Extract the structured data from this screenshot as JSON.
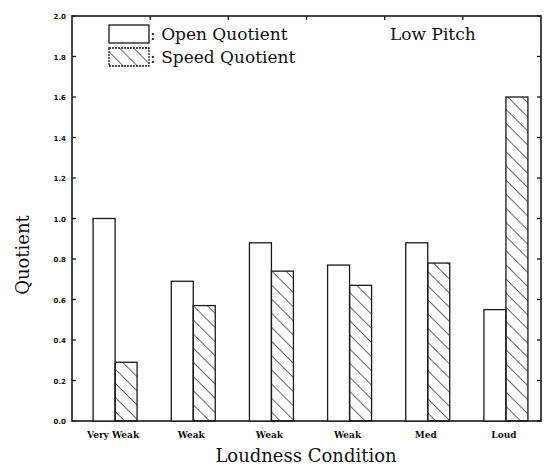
{
  "chart_data": {
    "type": "bar",
    "title": "",
    "annotation": "Low Pitch",
    "xlabel": "Loudness Condition",
    "ylabel": "Quotient",
    "ylim": [
      0,
      2.0
    ],
    "yticks": [
      "0.0",
      "0.2",
      "0.4",
      "0.6",
      "0.8",
      "1.0",
      "1.2",
      "1.4",
      "1.6",
      "1.8",
      "2.0"
    ],
    "grid": false,
    "legend_position": "top-left inside",
    "categories": [
      "Very Weak",
      "Weak",
      "Weak",
      "Weak",
      "Med",
      "Loud"
    ],
    "series": [
      {
        "name": "Open Quotient",
        "pattern": "empty",
        "values": [
          1.0,
          0.69,
          0.88,
          0.77,
          0.88,
          0.55
        ]
      },
      {
        "name": "Speed Quotient",
        "pattern": "hatched",
        "values": [
          0.29,
          0.57,
          0.74,
          0.67,
          0.78,
          1.6
        ]
      }
    ]
  },
  "legend": {
    "open_label": ": Open Quotient",
    "speed_label": ": Speed Quotient"
  },
  "colors": {
    "line": "#1a1a1a",
    "background": "#ffffff"
  }
}
